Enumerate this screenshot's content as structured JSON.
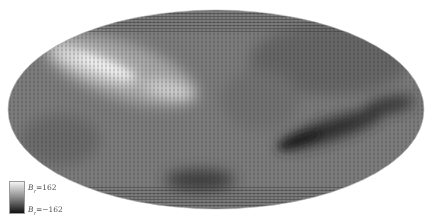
{
  "figure": {
    "projection": "Mollweide",
    "colormap": {
      "high_color": "#f4f4f4",
      "mid_color": "#7a7a7a",
      "low_color": "#111111"
    }
  },
  "colorbar": {
    "max_label_symbol": "B",
    "max_label_sub": "r",
    "max_label_value": "=162",
    "min_label_symbol": "B",
    "min_label_sub": "r",
    "min_label_value": "=−162"
  },
  "features": {
    "bright_band": "Bright streak across upper-left running from left limb toward center",
    "dark_band": "Dark streak on right side from center-right toward right limb, plus dark patch lower-center"
  }
}
